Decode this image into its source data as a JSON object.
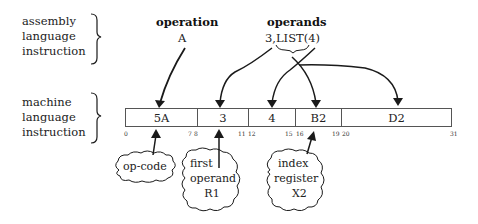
{
  "left_labels": {
    "assembly": [
      "assembly",
      "language",
      "instruction"
    ],
    "machine": [
      "machine",
      "language",
      "instruction"
    ]
  },
  "assembly": {
    "operation_heading": "operation",
    "operation_value": "A",
    "operands_heading": "operands",
    "operands_value": "3,LIST(4)"
  },
  "machine_fields": [
    {
      "value": "5A",
      "bit_start": "0",
      "bit_end": "7"
    },
    {
      "value": "3",
      "bit_start": "8",
      "bit_end": "11"
    },
    {
      "value": "4",
      "bit_start": "12",
      "bit_end": "15"
    },
    {
      "value": "B2",
      "bit_start": "16",
      "bit_end": "19"
    },
    {
      "value": "D2",
      "bit_start": "20",
      "bit_end": "31"
    }
  ],
  "callouts": {
    "opcode": [
      "op-code"
    ],
    "first_operand": [
      "first",
      "operand",
      "R1"
    ],
    "index_register": [
      "index",
      "register",
      "X2"
    ]
  },
  "colors": {
    "stroke": "#1a1a1a",
    "text": "#222222",
    "background": "#ffffff"
  }
}
